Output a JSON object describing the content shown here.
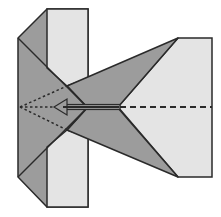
{
  "diagram": {
    "title": "",
    "type": "origami-fold-step",
    "colors": {
      "background": "#ffffff",
      "paper_front": "#e4e4e4",
      "paper_back": "#9c9c9c",
      "edge": "#2a2a2a",
      "crease": "#2a2a2a"
    },
    "elements": {
      "left_body": {
        "shape": "hexagon",
        "fill": "paper_back"
      },
      "top_flap": {
        "shape": "rectangle",
        "fill": "paper_front"
      },
      "bottom_flap": {
        "shape": "rectangle",
        "fill": "paper_front"
      },
      "right_panel": {
        "shape": "pentagon",
        "fill": "paper_front"
      },
      "upper_wing": {
        "shape": "triangle",
        "fill": "paper_back"
      },
      "lower_wing": {
        "shape": "triangle",
        "fill": "paper_back"
      },
      "valley_fold_line": {
        "style": "dashed",
        "direction": "horizontal"
      },
      "hidden_folds": {
        "style": "dotted",
        "count": 3
      },
      "fold_arrow": {
        "direction": "left",
        "meaning": "fold-in"
      }
    }
  }
}
